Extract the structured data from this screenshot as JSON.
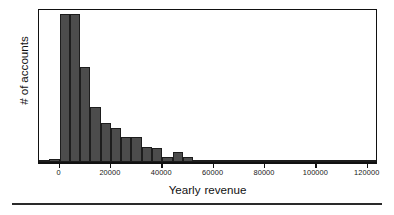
{
  "chart_data": {
    "type": "bar",
    "title": "",
    "subtitle": "",
    "xlabel": "Yearly revenue",
    "ylabel": "# of accounts",
    "xlim": [
      -8000,
      124000
    ],
    "ylim": [
      0,
      100
    ],
    "grid": false,
    "legend": null,
    "bin_width": 4000,
    "bar_color": "#4c4c4c",
    "bar_edge_color": "#1d1d1d",
    "frame_color": "#111111",
    "background_color": "#ffffff",
    "xticks": [
      0,
      20000,
      40000,
      60000,
      80000,
      100000,
      120000
    ],
    "xticklabels": [
      "0",
      "20000",
      "40000",
      "60000",
      "80000",
      "100000",
      "120000"
    ],
    "yticks": [],
    "yticklabels": [],
    "bins": [
      {
        "x0": -8000,
        "x1": -4000,
        "value": 1.5
      },
      {
        "x0": -4000,
        "x1": 0,
        "value": 2.0
      },
      {
        "x0": 0,
        "x1": 4000,
        "value": 96.0
      },
      {
        "x0": 4000,
        "x1": 8000,
        "value": 96.0
      },
      {
        "x0": 8000,
        "x1": 12000,
        "value": 62.0
      },
      {
        "x0": 12000,
        "x1": 16000,
        "value": 35.5
      },
      {
        "x0": 16000,
        "x1": 20000,
        "value": 25.5
      },
      {
        "x0": 20000,
        "x1": 24000,
        "value": 22.0
      },
      {
        "x0": 24000,
        "x1": 28000,
        "value": 16.5
      },
      {
        "x0": 28000,
        "x1": 32000,
        "value": 16.0
      },
      {
        "x0": 32000,
        "x1": 36000,
        "value": 9.5
      },
      {
        "x0": 36000,
        "x1": 40000,
        "value": 9.0
      },
      {
        "x0": 40000,
        "x1": 44000,
        "value": 3.5
      },
      {
        "x0": 44000,
        "x1": 48000,
        "value": 6.5
      },
      {
        "x0": 48000,
        "x1": 52000,
        "value": 3.0
      },
      {
        "x0": 52000,
        "x1": 56000,
        "value": 1.2
      },
      {
        "x0": 56000,
        "x1": 60000,
        "value": 1.0
      },
      {
        "x0": 60000,
        "x1": 64000,
        "value": 0.9
      },
      {
        "x0": 64000,
        "x1": 68000,
        "value": 0.9
      },
      {
        "x0": 68000,
        "x1": 72000,
        "value": 0.8
      },
      {
        "x0": 72000,
        "x1": 76000,
        "value": 0.8
      },
      {
        "x0": 76000,
        "x1": 80000,
        "value": 1.4
      },
      {
        "x0": 80000,
        "x1": 84000,
        "value": 0.8
      },
      {
        "x0": 84000,
        "x1": 88000,
        "value": 1.4
      },
      {
        "x0": 88000,
        "x1": 92000,
        "value": 0.6
      },
      {
        "x0": 92000,
        "x1": 96000,
        "value": 0.6
      },
      {
        "x0": 96000,
        "x1": 100000,
        "value": 0.6
      },
      {
        "x0": 100000,
        "x1": 104000,
        "value": 0.6
      },
      {
        "x0": 104000,
        "x1": 108000,
        "value": 0.6
      },
      {
        "x0": 108000,
        "x1": 112000,
        "value": 1.6
      },
      {
        "x0": 112000,
        "x1": 116000,
        "value": 0.6
      },
      {
        "x0": 116000,
        "x1": 120000,
        "value": 1.4
      },
      {
        "x0": 120000,
        "x1": 124000,
        "value": 0.9
      }
    ]
  }
}
